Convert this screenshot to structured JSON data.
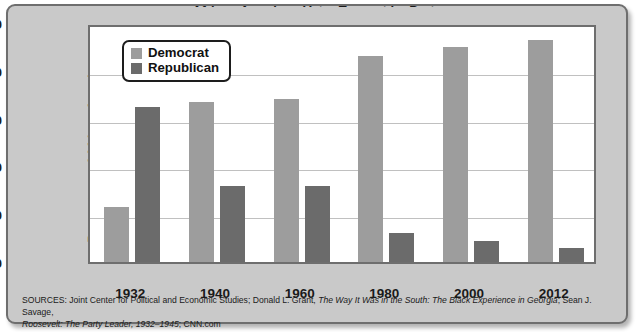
{
  "chart_data": {
    "type": "bar",
    "title": "African American Voter Turnout by Party",
    "xlabel": "",
    "ylabel": "Percentage of African Americans who voted",
    "ylabel_line1": "Percentage of African Americans",
    "ylabel_line2": "who voted",
    "categories": [
      "1932",
      "1940",
      "1960",
      "1980",
      "2000",
      "2012"
    ],
    "ylim": [
      0,
      100
    ],
    "yticks": [
      0,
      20,
      40,
      60,
      80,
      100
    ],
    "grid": true,
    "legend_position": "top-left",
    "series": [
      {
        "name": "Democrat",
        "color": "#9d9d9d",
        "values": [
          23,
          67,
          68,
          86,
          90,
          93
        ]
      },
      {
        "name": "Republican",
        "color": "#6b6b6b",
        "values": [
          65,
          32,
          32,
          12,
          9,
          6
        ]
      }
    ]
  },
  "legend": {
    "items": [
      {
        "label": "Democrat",
        "swatch": "#9d9d9d"
      },
      {
        "label": "Republican",
        "swatch": "#6b6b6b"
      }
    ]
  },
  "sources": {
    "line1_prefix": "SOURCES: Joint Center for Political and Economic Studies; Donald L. Grant, ",
    "line1_italic": "The Way It Was in the South: The Black Experience in Georgia",
    "line1_suffix": "; Sean J. Savage,",
    "line2_italic": "Roosevelt: The Party Leader, 1932–1945",
    "line2_suffix": "; CNN.com"
  },
  "colors": {
    "democrat": "#9d9d9d",
    "republican": "#6b6b6b",
    "frame": "#6e6e6e",
    "background": "#c9c9c9",
    "plot_background": "#ffffff",
    "gridline": "#c0c0c0"
  }
}
